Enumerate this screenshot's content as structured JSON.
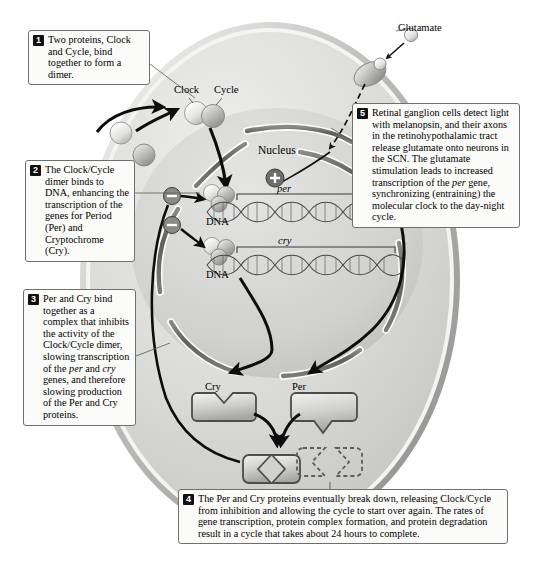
{
  "figure": {
    "callouts": [
      {
        "number": "1",
        "text": "Two proteins, Clock and Cycle, bind together to form a dimer."
      },
      {
        "number": "2",
        "text": "The Clock/Cycle dimer binds to DNA, enhancing the transcription of the genes for Period (Per) and Cryptochrome (Cry)."
      },
      {
        "number": "3",
        "text": "Per and Cry bind together as a complex that inhibits the activity of the Clock/Cycle dimer, slowing transcription of the per and cry genes, and therefore slowing production of the Per and Cry proteins."
      },
      {
        "number": "4",
        "text": "The Per and Cry proteins eventually break down, releasing Clock/Cycle from inhibition and allowing the cycle to start over again. The rates of gene transcription, protein complex formation, and protein degradation result in a cycle that takes about 24 hours to complete."
      },
      {
        "number": "5",
        "text": "Retinal ganglion cells detect light with melanopsin, and their axons in the retinohypothalamic tract release glutamate onto neurons in the SCN. The glutamate stimulation leads to increased transcription of the per gene, synchronizing (entraining) the molecular clock to the day-night cycle."
      }
    ],
    "labels": {
      "clock": "Clock",
      "cycle": "Cycle",
      "nucleus": "Nucleus",
      "per_gene": "per",
      "cry_gene": "cry",
      "dna_upper": "DNA",
      "dna_lower": "DNA",
      "cry_protein": "Cry",
      "per_protein": "Per",
      "glutamate": "Glutamate"
    },
    "symbols": {
      "enhance": "+",
      "inhibit_upper": "–",
      "inhibit_lower": "–"
    },
    "colors": {
      "cell_fill": "#d9d9d7",
      "cell_membrane": "#b9b9b7",
      "nucleus_fill": "#cfcfcd",
      "envelope": "#6e6e6e",
      "protein_light": "#eeeeec",
      "protein_mid": "#b4b4b2",
      "arrow": "#0d0d0d",
      "callout_border": "#6f6f6f",
      "callout_fill": "#fbfbf9",
      "badge": "#111111"
    }
  }
}
